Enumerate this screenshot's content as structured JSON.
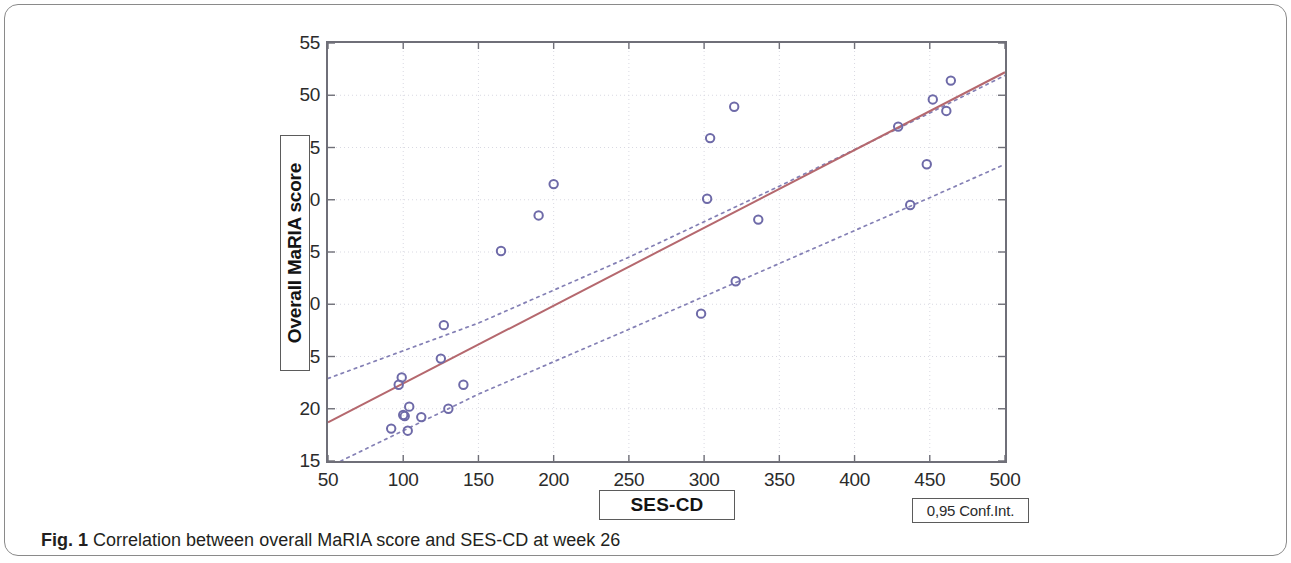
{
  "figure": {
    "caption_label": "Fig. 1",
    "caption_text": "Correlation between overall MaRIA score and SES-CD at week 26"
  },
  "legend": {
    "conf_int_label": "0,95 Conf.Int."
  },
  "chart_data": {
    "type": "scatter",
    "title": "",
    "xlabel": "SES-CD",
    "ylabel": "Overall MaRIA score",
    "xlim": [
      50,
      500
    ],
    "ylim": [
      15,
      55
    ],
    "xticks": [
      50,
      100,
      150,
      200,
      250,
      300,
      350,
      400,
      450,
      500
    ],
    "yticks": [
      15,
      20,
      25,
      30,
      35,
      40,
      45,
      50,
      55
    ],
    "grid": true,
    "legend_position": "bottom-right",
    "marker_color": "#6e6aa8",
    "marker_style": "open-circle",
    "fit_line_color": "#b5686e",
    "conf_band_color": "#6e6aa8",
    "conf_band_style": "dotted",
    "points": [
      {
        "x": 92,
        "y": 18.1
      },
      {
        "x": 97,
        "y": 22.3
      },
      {
        "x": 99,
        "y": 23.0
      },
      {
        "x": 100,
        "y": 19.4
      },
      {
        "x": 101,
        "y": 19.3
      },
      {
        "x": 103,
        "y": 17.9
      },
      {
        "x": 104,
        "y": 20.2
      },
      {
        "x": 112,
        "y": 19.2
      },
      {
        "x": 125,
        "y": 24.8
      },
      {
        "x": 127,
        "y": 28.0
      },
      {
        "x": 130,
        "y": 20.0
      },
      {
        "x": 140,
        "y": 22.3
      },
      {
        "x": 165,
        "y": 35.1
      },
      {
        "x": 190,
        "y": 38.5
      },
      {
        "x": 200,
        "y": 41.5
      },
      {
        "x": 298,
        "y": 29.1
      },
      {
        "x": 302,
        "y": 40.1
      },
      {
        "x": 304,
        "y": 45.9
      },
      {
        "x": 320,
        "y": 48.9
      },
      {
        "x": 321,
        "y": 32.2
      },
      {
        "x": 336,
        "y": 38.1
      },
      {
        "x": 429,
        "y": 47.0
      },
      {
        "x": 437,
        "y": 39.5
      },
      {
        "x": 448,
        "y": 43.4
      },
      {
        "x": 452,
        "y": 49.6
      },
      {
        "x": 461,
        "y": 48.5
      },
      {
        "x": 464,
        "y": 51.4
      }
    ],
    "fit_line": {
      "x1": 50,
      "y1": 18.7,
      "x2": 500,
      "y2": 52.2
    },
    "conf_upper": [
      {
        "x": 50,
        "y": 22.9
      },
      {
        "x": 150,
        "y": 28.2
      },
      {
        "x": 250,
        "y": 34.5
      },
      {
        "x": 350,
        "y": 41.3
      },
      {
        "x": 450,
        "y": 48.3
      },
      {
        "x": 500,
        "y": 51.9
      }
    ],
    "conf_lower": [
      {
        "x": 50,
        "y": 14.4
      },
      {
        "x": 150,
        "y": 21.4
      },
      {
        "x": 250,
        "y": 27.6
      },
      {
        "x": 350,
        "y": 33.9
      },
      {
        "x": 450,
        "y": 40.2
      },
      {
        "x": 500,
        "y": 43.4
      }
    ]
  }
}
